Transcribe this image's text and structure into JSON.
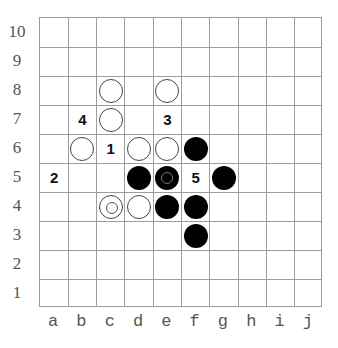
{
  "board": {
    "columns": [
      "a",
      "b",
      "c",
      "d",
      "e",
      "f",
      "g",
      "h",
      "i",
      "j"
    ],
    "rows": [
      "10",
      "9",
      "8",
      "7",
      "6",
      "5",
      "4",
      "3",
      "2",
      "1"
    ],
    "colors": {
      "black": "#000000",
      "white": "#ffffff",
      "grid": "#9c9c9c"
    }
  },
  "stones": [
    {
      "coord": "c8",
      "color": "white",
      "marked": false
    },
    {
      "coord": "e8",
      "color": "white",
      "marked": false
    },
    {
      "coord": "c7",
      "color": "white",
      "marked": false
    },
    {
      "coord": "b6",
      "color": "white",
      "marked": false
    },
    {
      "coord": "d6",
      "color": "white",
      "marked": false
    },
    {
      "coord": "e6",
      "color": "white",
      "marked": false
    },
    {
      "coord": "f6",
      "color": "black",
      "marked": false
    },
    {
      "coord": "d5",
      "color": "black",
      "marked": false
    },
    {
      "coord": "e5",
      "color": "black",
      "marked": true
    },
    {
      "coord": "g5",
      "color": "black",
      "marked": false
    },
    {
      "coord": "c4",
      "color": "white",
      "marked": true
    },
    {
      "coord": "d4",
      "color": "white",
      "marked": false
    },
    {
      "coord": "e4",
      "color": "black",
      "marked": false
    },
    {
      "coord": "f4",
      "color": "black",
      "marked": false
    },
    {
      "coord": "f3",
      "color": "black",
      "marked": false
    }
  ],
  "labels": [
    {
      "coord": "c6",
      "text": "1"
    },
    {
      "coord": "a5",
      "text": "2"
    },
    {
      "coord": "e7",
      "text": "3"
    },
    {
      "coord": "b7",
      "text": "4"
    },
    {
      "coord": "f5",
      "text": "5"
    }
  ]
}
